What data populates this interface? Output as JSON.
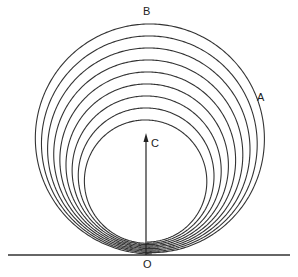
{
  "figure": {
    "type": "spiral-diagram",
    "labels": {
      "top": "B",
      "right": "A",
      "center": "C",
      "origin": "O"
    },
    "spiral_turns": 9,
    "caption": "Fig. showing the spiral path traced about point C (caption cut off at bottom of image)",
    "line_color": "#333333",
    "background": "#ffffff"
  }
}
